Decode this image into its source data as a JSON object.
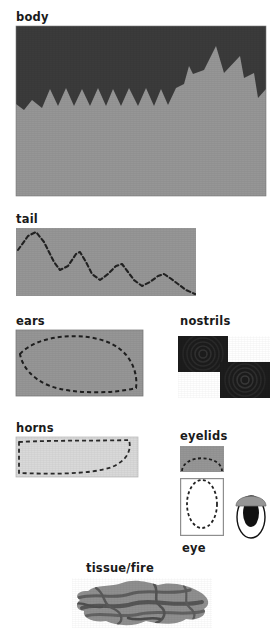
{
  "page": {
    "background": "#ffffff",
    "width": 280,
    "height": 632
  },
  "palette": {
    "dark_gray": "#3b3b3b",
    "mid_gray": "#969696",
    "light_gray": "#d9d9d9",
    "near_black": "#1c1c1c",
    "outline": "#2b2b2b",
    "label_color": "#1a1a1a",
    "white": "#ffffff"
  },
  "labels": {
    "body": "body",
    "tail": "tail",
    "ears": "ears",
    "nostrils": "nostrils",
    "horns": "horns",
    "eyelids": "eyelids",
    "arms": "arms",
    "eye": "eye",
    "tissue_fire": "tissue/fire"
  },
  "panels": {
    "body": {
      "name": "body",
      "x": 16,
      "y": 26,
      "width": 250,
      "height": 170,
      "fill_top": "#3b3b3b",
      "fill_bottom": "#969696",
      "description": "dark field above a light gray field separated by a jagged zigzag horizon with a tall star-like spike at right"
    },
    "tail": {
      "name": "tail",
      "x": 16,
      "y": 228,
      "width": 180,
      "height": 68,
      "fill": "#969696",
      "line_style": "dashed",
      "description": "descending dashed zigzag polyline on mid gray"
    },
    "ears": {
      "name": "ears",
      "x": 16,
      "y": 330,
      "width": 127,
      "height": 66,
      "fill": "#969696",
      "line_style": "dashed",
      "description": "leaf / lens shaped dashed outline filling the rectangle"
    },
    "nostrils": {
      "name": "nostrils",
      "x": 178,
      "y": 336,
      "width": 92,
      "height": 62,
      "fill": "#1c1c1c",
      "description": "two dark squares offset diagonally with faint concentric spiral texture"
    },
    "horns": {
      "name": "horns",
      "x": 16,
      "y": 437,
      "width": 122,
      "height": 40,
      "fill": "#d9d9d9",
      "line_style": "dashed",
      "description": "light gray rectangle containing a crescent band dashed outline"
    },
    "eyelids": {
      "name": "eyelids",
      "x": 180,
      "y": 446,
      "width": 44,
      "height": 26,
      "fill": "#969696",
      "line_style": "dashed",
      "description": "gray rectangle with a dashed dome arc, plus a white box below with a dashed arc"
    },
    "arms": {
      "name": "arms",
      "x": 16,
      "y": 500,
      "width": 122,
      "height": 41,
      "fill": "#969696",
      "line_style": "dashed",
      "description": "mid gray rectangle bounded by a dashed border"
    },
    "eye_box": {
      "name": "eye-box",
      "x": 180,
      "y": 478,
      "width": 44,
      "height": 58,
      "fill": "#ffffff",
      "line_style": "dashed",
      "description": "white box framed in gray with a dashed vertical oval inside"
    },
    "eye_icon": {
      "name": "eye-icon",
      "x": 232,
      "y": 489,
      "width": 38,
      "height": 52,
      "fill_sclera": "#ffffff",
      "fill_pupil": "#111111",
      "fill_lid": "#969696",
      "description": "oval sclera outlined in black, tall black pupil, gray dome eyelid over the top"
    },
    "tissue_fire": {
      "name": "tissue-fire",
      "x": 72,
      "y": 578,
      "width": 140,
      "height": 50,
      "fill": "#8f8f8f",
      "vein_fill": "#5e5e5e",
      "description": "irregular organic blob with darker marbled veins"
    }
  },
  "label_positions": {
    "body": {
      "x": 16,
      "y": 12
    },
    "tail": {
      "x": 16,
      "y": 214
    },
    "ears": {
      "x": 16,
      "y": 316
    },
    "nostrils": {
      "x": 180,
      "y": 316
    },
    "horns": {
      "x": 16,
      "y": 423
    },
    "eyelids": {
      "x": 180,
      "y": 431
    },
    "arms": {
      "x": 16,
      "y": 486
    },
    "eye": {
      "x": 182,
      "y": 543
    },
    "tissue_fire": {
      "x": 86,
      "y": 563
    }
  }
}
